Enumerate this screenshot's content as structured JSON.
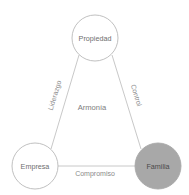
{
  "diagram": {
    "title_visible": false,
    "background_color": "#ffffff",
    "nodes": [
      {
        "id": "propiedad",
        "label": "Propiedad",
        "position": "top",
        "cx": 95,
        "cy": 38,
        "r": 23,
        "fill": "#ffffff",
        "stroke": "#b9b9b9",
        "highlighted": false
      },
      {
        "id": "empresa",
        "label": "Empresa",
        "position": "bottom-left",
        "cx": 35,
        "cy": 166,
        "r": 23,
        "fill": "#ffffff",
        "stroke": "#b9b9b9",
        "highlighted": false
      },
      {
        "id": "familia",
        "label": "Familia",
        "position": "bottom-right",
        "cx": 158,
        "cy": 166,
        "r": 23,
        "fill": "#a8a8a8",
        "stroke": "#a8a8a8",
        "highlighted": true
      }
    ],
    "edges": [
      {
        "id": "propiedad-empresa",
        "label": "Liderazgo",
        "from": "propiedad",
        "to": "empresa",
        "side": "left",
        "rotated": true,
        "stroke": "#c2c2c2"
      },
      {
        "id": "propiedad-familia",
        "label": "Control",
        "from": "propiedad",
        "to": "familia",
        "side": "right",
        "rotated": true,
        "stroke": "#c2c2c2"
      },
      {
        "id": "empresa-familia",
        "label": "Compromiso",
        "from": "empresa",
        "to": "familia",
        "side": "bottom",
        "rotated": false,
        "stroke": "#c2c2c2"
      }
    ],
    "center_label": "Armonía",
    "colors": {
      "line": "#c2c2c2",
      "node_stroke": "#b9b9b9",
      "node_text": "#6e6e6e",
      "edge_text": "#8a8a8a",
      "center_text": "#7d7d7d",
      "highlight_fill": "#a8a8a8"
    }
  }
}
